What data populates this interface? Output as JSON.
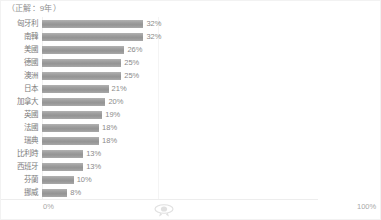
{
  "chart_title": "（正解：9年）",
  "watermark_icon": "ribbon-badge-icon",
  "axis": {
    "x_tick_min": "0%",
    "x_tick_max": "100%"
  },
  "colors": {
    "bar": "#9d9d9d",
    "bar_highlight": "#b2b2b2",
    "label_text": "#7b7b7b",
    "value_text": "#8a8a8a",
    "tick_text": "#a8a8a8",
    "frame_border": "#f2f2f2",
    "axis_line": "#ededed"
  },
  "chart_data": {
    "type": "bar",
    "orientation": "horizontal",
    "title": "（正解：9年）",
    "xlabel": "",
    "ylabel": "",
    "xlim": [
      0,
      100
    ],
    "grid": false,
    "legend": false,
    "value_suffix": "%",
    "categories": [
      "匈牙利",
      "南韓",
      "美國",
      "德國",
      "澳洲",
      "日本",
      "加拿大",
      "英國",
      "法國",
      "瑞典",
      "比利時",
      "西班牙",
      "芬蘭",
      "挪威"
    ],
    "values": [
      32,
      32,
      26,
      25,
      25,
      21,
      20,
      19,
      18,
      18,
      13,
      13,
      10,
      8
    ],
    "value_labels": [
      "32%",
      "32%",
      "26%",
      "25%",
      "25%",
      "21%",
      "20%",
      "19%",
      "18%",
      "18%",
      "13%",
      "13%",
      "10%",
      "8%"
    ]
  }
}
